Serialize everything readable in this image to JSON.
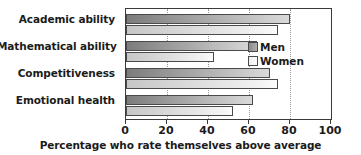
{
  "chart_data": {
    "type": "bar",
    "orientation": "horizontal",
    "title": "",
    "subtitle": "",
    "xlabel": "Percentage who rate themselves above average",
    "ylabel": "",
    "xlim": [
      0,
      100
    ],
    "xticks": [
      0,
      20,
      40,
      60,
      80,
      100
    ],
    "xtick_labels": [
      "0",
      "20",
      "40",
      "60",
      "80",
      "100"
    ],
    "grid": "vertical-dotted",
    "legend_position": "inside-right",
    "categories": [
      "Academic ability",
      "Mathematical ability",
      "Competitiveness",
      "Emotional health"
    ],
    "series": [
      {
        "name": "Men",
        "color": "#9a9a9a",
        "values": [
          80,
          64,
          70,
          62
        ]
      },
      {
        "name": "Women",
        "color": "#e8e8e8",
        "values": [
          74,
          43,
          74,
          52
        ]
      }
    ]
  },
  "legend": {
    "items": [
      {
        "label": "Men"
      },
      {
        "label": "Women"
      }
    ]
  },
  "colors": {
    "men_dark": "#7c7c7c",
    "men_light": "#d9d9d9",
    "women_dark": "#c6c6c6",
    "women_light": "#fbfbfb",
    "axis": "#3a3a3a",
    "grid": "#9a9a9a",
    "text": "#1b1b1b",
    "background": "#ffffff"
  }
}
